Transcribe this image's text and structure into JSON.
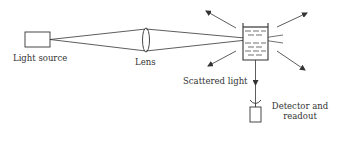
{
  "diagram": {
    "type": "light scattering setup schematic",
    "colors": {
      "stroke": "#333333",
      "text": "#333333",
      "background": "#ffffff"
    },
    "components": {
      "light_source": {
        "label": "Light source",
        "icon": "rectangle-box"
      },
      "lens": {
        "label": "Lens",
        "icon": "biconvex-lens-ellipse"
      },
      "sample_cell": {
        "label": "",
        "icon": "cuvette-with-liquid"
      },
      "scattered_light": {
        "label": "Scattered light",
        "icon": "radiating-arrows"
      },
      "detector": {
        "line1": "Detector and",
        "line2": "readout",
        "icon": "detector-cup-and-box"
      }
    }
  }
}
